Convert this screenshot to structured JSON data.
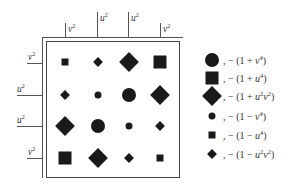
{
  "diagram": {
    "top_axis": {
      "labels": [
        {
          "var": "v",
          "exp": "2"
        },
        {
          "var": "u",
          "exp": "2"
        },
        {
          "var": "u",
          "exp": "2"
        },
        {
          "var": "v",
          "exp": "2"
        }
      ]
    },
    "left_axis": {
      "labels": [
        {
          "var": "v",
          "exp": "2"
        },
        {
          "var": "u",
          "exp": "2"
        },
        {
          "var": "u",
          "exp": "2"
        },
        {
          "var": "v",
          "exp": "2"
        }
      ]
    },
    "grid": [
      [
        "small-square",
        "small-diamond",
        "large-diamond",
        "large-square"
      ],
      [
        "small-diamond",
        "small-circle",
        "large-circle",
        "large-diamond"
      ],
      [
        "large-diamond",
        "large-circle",
        "small-circle",
        "small-diamond"
      ],
      [
        "large-square",
        "large-diamond",
        "small-diamond",
        "small-square"
      ]
    ],
    "legend": [
      {
        "marker": "large-circle",
        "sep": ",",
        "sign": "−",
        "open": "(1 + ",
        "a": "v",
        "a_exp": "4",
        "b": "",
        "b_exp": "",
        "close": ")"
      },
      {
        "marker": "large-square",
        "sep": ",",
        "sign": "−",
        "open": "(1 + ",
        "a": "u",
        "a_exp": "4",
        "b": "",
        "b_exp": "",
        "close": ")"
      },
      {
        "marker": "large-diamond",
        "sep": ",",
        "sign": "−",
        "open": "(1 + ",
        "a": "u",
        "a_exp": "2",
        "b": "v",
        "b_exp": "2",
        "close": ")"
      },
      {
        "marker": "small-circle",
        "sep": ",",
        "sign": "−",
        "open": "(1 − ",
        "a": "v",
        "a_exp": "4",
        "b": "",
        "b_exp": "",
        "close": ")"
      },
      {
        "marker": "small-square",
        "sep": ",",
        "sign": "−",
        "open": "(1 − ",
        "a": "u",
        "a_exp": "4",
        "b": "",
        "b_exp": "",
        "close": ")"
      },
      {
        "marker": "small-diamond",
        "sep": ",",
        "sign": "−",
        "open": "(1 − ",
        "a": "u",
        "a_exp": "2",
        "b": "v",
        "b_exp": "2",
        "close": ")"
      }
    ],
    "colors": {
      "ink": "#1a1a1a",
      "line": "#555555",
      "background": "#ffffff"
    }
  }
}
